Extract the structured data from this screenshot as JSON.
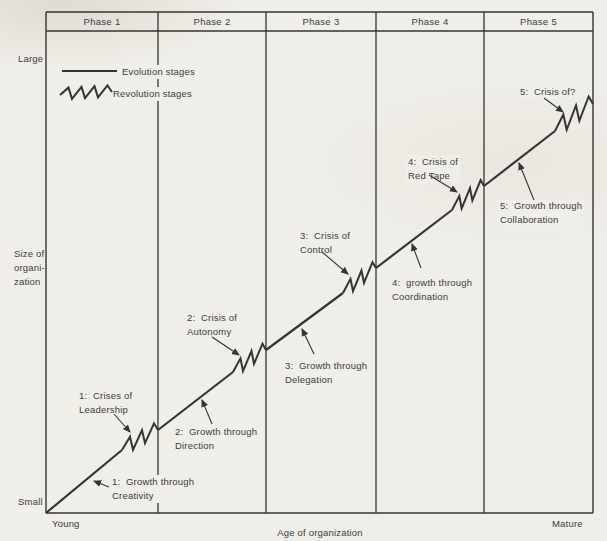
{
  "colors": {
    "paper": "#f0eee8",
    "ink": "#343434",
    "text": "#3b3b3b"
  },
  "header": {
    "phases": [
      {
        "label": "Phase 1"
      },
      {
        "label": "Phase 2"
      },
      {
        "label": "Phase 3"
      },
      {
        "label": "Phase 4"
      },
      {
        "label": "Phase 5"
      }
    ]
  },
  "legend": {
    "evolution": "Evolution stages",
    "revolution": "Revolution stages"
  },
  "axes": {
    "y_top": "Large",
    "y_bottom": "Small",
    "y_title": "Size of\norgani-\nzation",
    "x_left": "Young",
    "x_right": "Mature",
    "x_title": "Age of organization"
  },
  "diagram": {
    "frame": {
      "left": 46,
      "right": 593,
      "top": 12,
      "band_bottom": 31,
      "bottom": 513
    },
    "dividers": [
      158,
      266,
      376,
      484
    ],
    "curve": {
      "evolution": [
        [
          46,
          513,
          122,
          450
        ],
        [
          158,
          430,
          233,
          372
        ],
        [
          266,
          350,
          343,
          293
        ],
        [
          376,
          268,
          452,
          210
        ],
        [
          484,
          186,
          555,
          131
        ]
      ],
      "zigzags": [
        {
          "from": [
            122,
            450
          ],
          "to": [
            158,
            430
          ],
          "teeth": 3,
          "amp": 10
        },
        {
          "from": [
            233,
            372
          ],
          "to": [
            266,
            350
          ],
          "teeth": 3,
          "amp": 10
        },
        {
          "from": [
            343,
            293
          ],
          "to": [
            376,
            268
          ],
          "teeth": 3,
          "amp": 10
        },
        {
          "from": [
            452,
            210
          ],
          "to": [
            484,
            186
          ],
          "teeth": 3,
          "amp": 10
        },
        {
          "from": [
            555,
            131
          ],
          "to": [
            593,
            104
          ],
          "teeth": 3,
          "amp": 12
        }
      ]
    },
    "legend_marks": {
      "line": [
        62,
        71,
        117,
        71
      ],
      "zigzag": {
        "from": [
          60,
          95
        ],
        "to": [
          112,
          92
        ],
        "teeth": 4,
        "amp": 7
      }
    },
    "labels": [
      {
        "name": "label-growth-creativity",
        "text": "1:  Growth through\nCreativity",
        "x": 110,
        "y": 475,
        "arrow": [
          109,
          487,
          94,
          481
        ]
      },
      {
        "name": "label-crises-leadership",
        "text": "1:  Crises of\nLeadership",
        "x": 77,
        "y": 389,
        "arrow": [
          114,
          414,
          130,
          432
        ]
      },
      {
        "name": "label-growth-direction",
        "text": "2:  Growth through\nDirection",
        "x": 173,
        "y": 425,
        "arrow": [
          212,
          424,
          202,
          400
        ]
      },
      {
        "name": "label-crisis-autonomy",
        "text": "2:  Crisis of\nAutonomy",
        "x": 185,
        "y": 311,
        "arrow": [
          212,
          337,
          239,
          355
        ]
      },
      {
        "name": "label-growth-delegation",
        "text": "3:  Growth through\nDelegation",
        "x": 283,
        "y": 359,
        "arrow": [
          314,
          354,
          302,
          329
        ]
      },
      {
        "name": "label-crisis-control",
        "text": "3:  Crisis of\nControl",
        "x": 298,
        "y": 229,
        "arrow": [
          322,
          252,
          348,
          274
        ]
      },
      {
        "name": "label-growth-coordination",
        "text": "4:  growth through\nCoordination",
        "x": 390,
        "y": 276,
        "arrow": [
          421,
          268,
          412,
          244
        ]
      },
      {
        "name": "label-crisis-red-tape",
        "text": "4:  Crisis of\nRed Tape",
        "x": 406,
        "y": 155,
        "arrow": [
          429,
          175,
          457,
          192
        ]
      },
      {
        "name": "label-growth-collaboration",
        "text": "5:  Growth through\nCollaboration",
        "x": 498,
        "y": 199,
        "arrow": [
          534,
          200,
          519,
          163
        ]
      },
      {
        "name": "label-crisis-of-question",
        "text": "5:  Crisis of?",
        "x": 518,
        "y": 85,
        "arrow": [
          544,
          98,
          563,
          112
        ]
      }
    ]
  }
}
